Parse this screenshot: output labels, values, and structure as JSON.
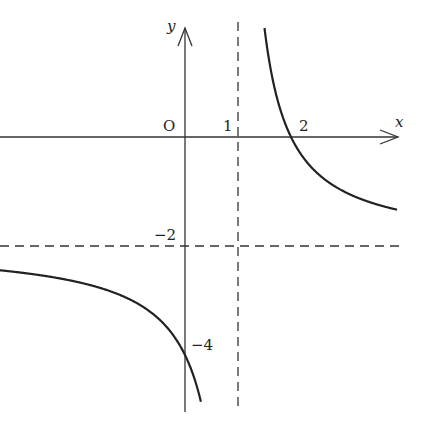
{
  "chart_data": {
    "type": "line",
    "title": "",
    "function": "y = -2 + 2/(x - 1)",
    "xlabel": "x",
    "ylabel": "y",
    "origin_label": "O",
    "tick_labels": {
      "x": [
        "1",
        "2"
      ],
      "y": [
        "-2",
        "-4"
      ]
    },
    "asymptotes": {
      "vertical": 1,
      "horizontal": -2
    },
    "key_points": [
      {
        "x": 0,
        "y": -4
      },
      {
        "x": 2,
        "y": 0
      }
    ],
    "xlim": [
      -3.5,
      4.1
    ],
    "ylim": [
      -5.2,
      2.5
    ],
    "grid": false,
    "legend": null,
    "series": [
      {
        "name": "left branch",
        "x_range": [
          -3.5,
          0.3
        ]
      },
      {
        "name": "right branch",
        "x_range": [
          1.5,
          4.0
        ]
      }
    ],
    "colors": {
      "curve": "#222222",
      "axes": "#333333",
      "asymptote": "#333333"
    }
  },
  "labels": {
    "x_axis": "x",
    "y_axis": "y",
    "origin": "O",
    "tick_x1": "1",
    "tick_x2": "2",
    "tick_ym2": "−2",
    "tick_ym4": "−4"
  }
}
